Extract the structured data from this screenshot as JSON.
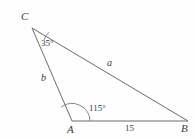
{
  "figure": {
    "type": "triangle-diagram",
    "background_color": "#fefefe",
    "stroke_color": "#6b6b6b",
    "text_color": "#3b3b3b"
  },
  "vertices": [
    {
      "id": "C",
      "label": "C",
      "x": 32,
      "y": 28,
      "label_x": 21,
      "label_y": 11
    },
    {
      "id": "A",
      "label": "A",
      "x": 72,
      "y": 121,
      "label_x": 67,
      "label_y": 124
    },
    {
      "id": "B",
      "label": "B",
      "x": 188,
      "y": 121,
      "label_x": 181,
      "label_y": 123
    }
  ],
  "sides": [
    {
      "id": "a",
      "label": "a",
      "from": "C",
      "to": "B",
      "label_x": 107,
      "label_y": 58
    },
    {
      "id": "b",
      "label": "b",
      "from": "C",
      "to": "A",
      "label_x": 41,
      "label_y": 73
    },
    {
      "id": "c",
      "label": "15",
      "from": "A",
      "to": "B",
      "label_x": 125,
      "label_y": 124
    }
  ],
  "angles": [
    {
      "at": "C",
      "label": "35°",
      "value": 35,
      "label_x": 41,
      "label_y": 39,
      "arc_radius": 17
    },
    {
      "at": "A",
      "label": "115°",
      "value": 115,
      "label_x": 89,
      "label_y": 104,
      "arc_radius": 18
    }
  ],
  "geometry": {
    "path_triangle": "M 32 28 L 188 121 L 72 121 Z",
    "arc_at_C": "M 44.1 39.9 A 17 17 0 0 1 48.9 32.3",
    "arc_at_A": "M 61.2 107.1 A 18 18 0 0 1 90 121"
  },
  "known": {
    "side_c_length": "15",
    "angle_C": "35°",
    "angle_A": "115°",
    "unknown_sides": [
      "a",
      "b"
    ]
  }
}
